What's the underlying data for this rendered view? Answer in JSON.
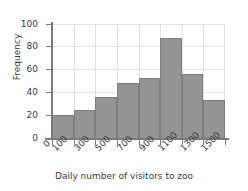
{
  "chart_data": {
    "type": "bar",
    "title": "",
    "subtitle": "",
    "xlabel": "Daily number of visitors to zoo",
    "ylabel": "Frequency",
    "categories": [
      "100",
      "300",
      "500",
      "700",
      "900",
      "1100",
      "1300",
      "1500"
    ],
    "values": [
      20,
      25,
      36,
      48,
      53,
      88,
      56,
      33
    ],
    "series": [
      {
        "name": "Frequency",
        "values": [
          20,
          25,
          36,
          48,
          53,
          88,
          56,
          33
        ]
      }
    ],
    "ylim": [
      0,
      100
    ],
    "yticks": [
      0,
      20,
      40,
      60,
      80,
      100
    ],
    "ytick_labels": [
      "0",
      "20",
      "40",
      "60",
      "80",
      "100"
    ],
    "xtick_labels": [
      "0",
      "100",
      "300",
      "500",
      "700",
      "900",
      "1100",
      "1300",
      "1500"
    ],
    "grid": true,
    "legend": false,
    "legend_position": "none",
    "bar_color": "#949494",
    "bar_edge_color": "#7d7d7d",
    "grid_color": "#e2e2e2",
    "axis_color": "#7a7a7a",
    "background_color": "#ffffff",
    "text_color": "#3a3a3a",
    "histogram_bin_width": 200,
    "annotations": []
  }
}
